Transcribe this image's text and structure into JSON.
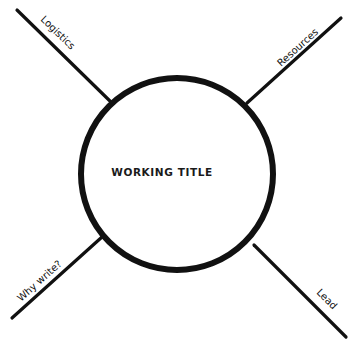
{
  "diagram": {
    "type": "spider-diagram",
    "center": {
      "title": "WORKING TITLE",
      "cx": 177,
      "cy": 174,
      "r": 96,
      "stroke_width": 6
    },
    "spokes": [
      {
        "id": "top-left",
        "label": "Logistics",
        "x1": 17,
        "y1": 10,
        "x2": 112,
        "y2": 103
      },
      {
        "id": "top-right",
        "label": "Resources",
        "x1": 341,
        "y1": 18,
        "x2": 247,
        "y2": 103
      },
      {
        "id": "bottom-left",
        "label": "Why write?",
        "x1": 12,
        "y1": 318,
        "x2": 102,
        "y2": 237
      },
      {
        "id": "bottom-right",
        "label": "Lead",
        "x1": 254,
        "y1": 245,
        "x2": 346,
        "y2": 337
      }
    ],
    "colors": {
      "background": "#ffffff",
      "ink": "#111111"
    }
  }
}
